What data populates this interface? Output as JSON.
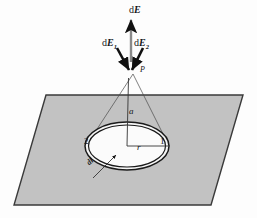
{
  "figure": {
    "background_color": "#fdfdfd",
    "plane": {
      "name": "charged-ring-plane",
      "fill_color": "#c2c2c2",
      "stroke_color": "#3a3a3a",
      "corners": [
        [
          46,
          95
        ],
        [
          243,
          95
        ],
        [
          211,
          205
        ],
        [
          14,
          205
        ]
      ]
    },
    "ring": {
      "name": "charged-ring",
      "center": [
        127,
        146
      ],
      "outer_rx": 42,
      "outer_ry": 24,
      "inner_rx": 38.5,
      "inner_ry": 21,
      "fill_color": "#f6f6f6",
      "stroke_color": "#1a1a1a"
    },
    "point_P": [
      133,
      72
    ],
    "axis_bottom": [
      127,
      146
    ]
  },
  "labels": {
    "field_total": "d",
    "field_total_vec": "E",
    "field_one": "d",
    "field_one_vec": "E",
    "field_one_sub": "1",
    "field_two": "d",
    "field_two_vec": "E",
    "field_two_sub": "2",
    "point": "P",
    "distance_axis": "a",
    "radius": "r",
    "element_one": "1",
    "element_two": "2",
    "length_element": "dl"
  },
  "colors": {
    "plane_fill": "#c2c2c2",
    "plane_edge": "#3a3a3a",
    "ring_stroke": "#1a1a1a",
    "ring_fill": "#f6f6f6",
    "arrow": "#111111",
    "guide_line": "#555555",
    "text": "#15161a"
  },
  "geometry_notes": {
    "vector_dE_arrow": "vertical arrow pointing up from P",
    "vector_dE1_arrow": "short thick arrow pointing down-right into P",
    "vector_dE2_arrow": "short thick arrow pointing down-left into P",
    "guide_lines": "two thin lines from P to opposite edges of ring (points 1 and 2), plus vertical axis of length a"
  }
}
